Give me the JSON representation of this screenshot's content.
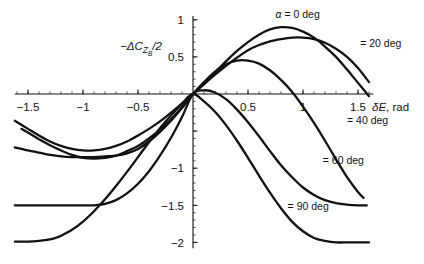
{
  "chart_data": {
    "type": "line",
    "title": "",
    "xlabel": "δE, rad",
    "ylabel": "−ΔC_{Z_B}/2",
    "xlabel_parts": {
      "delta": "δ",
      "var": "E",
      "rest": ", rad"
    },
    "ylabel_parts": {
      "minus": "−Δ",
      "c": "C",
      "sub": "Z",
      "subsub": "B",
      "div": "/2"
    },
    "xlim": [
      -1.62,
      1.64
    ],
    "ylim": [
      -2.08,
      1.05
    ],
    "grid": false,
    "legend_position": "inline-annotations",
    "xticks": [
      -1.5,
      -1,
      -0.5,
      0,
      0.5,
      1,
      1.5
    ],
    "xtick_labels": [
      "−1.5",
      "−1",
      "−0.5",
      "",
      "0.5",
      "1",
      "1.5"
    ],
    "yticks": [
      1,
      0.5,
      0,
      -0.5,
      -1,
      -1.5,
      -2
    ],
    "ytick_labels": [
      "1",
      "0.5",
      "",
      "",
      "−1",
      "−1.5",
      "−2"
    ],
    "minor_tick_step_x": 0.1,
    "minor_tick_step_y": 0.1,
    "series": [
      {
        "name": "alpha-0",
        "label": "α  = 0 deg",
        "label_alpha": "α",
        "label_rest": "= 0 deg",
        "alpha_deg": 0,
        "color": "#111111",
        "x": [
          -1.62,
          -1.5,
          -1.4,
          -1.3,
          -1.2,
          -1.1,
          -1.0,
          -0.9,
          -0.8,
          -0.7,
          -0.6,
          -0.5,
          -0.4,
          -0.3,
          -0.2,
          -0.1,
          0,
          0.1,
          0.2,
          0.3,
          0.4,
          0.5,
          0.6,
          0.7,
          0.8,
          0.9,
          1.0,
          1.1,
          1.2,
          1.3,
          1.4,
          1.5,
          1.6
        ],
        "y": [
          -0.36,
          -0.47,
          -0.56,
          -0.64,
          -0.7,
          -0.74,
          -0.76,
          -0.76,
          -0.74,
          -0.7,
          -0.64,
          -0.56,
          -0.47,
          -0.37,
          -0.25,
          -0.13,
          0,
          0.14,
          0.29,
          0.44,
          0.58,
          0.7,
          0.8,
          0.87,
          0.9,
          0.89,
          0.84,
          0.76,
          0.64,
          0.5,
          0.33,
          0.15,
          -0.03
        ]
      },
      {
        "name": "alpha-20",
        "label": "= 20 deg",
        "alpha_deg": 20,
        "color": "#111111",
        "x": [
          -1.56,
          -1.5,
          -1.4,
          -1.3,
          -1.2,
          -1.1,
          -1.0,
          -0.9,
          -0.8,
          -0.7,
          -0.6,
          -0.5,
          -0.4,
          -0.3,
          -0.2,
          -0.1,
          0,
          0.1,
          0.2,
          0.3,
          0.4,
          0.5,
          0.6,
          0.7,
          0.8,
          0.9,
          1.0,
          1.1,
          1.2,
          1.3,
          1.4,
          1.5,
          1.6
        ],
        "y": [
          -0.47,
          -0.52,
          -0.61,
          -0.69,
          -0.76,
          -0.82,
          -0.86,
          -0.87,
          -0.86,
          -0.83,
          -0.77,
          -0.7,
          -0.6,
          -0.48,
          -0.34,
          -0.18,
          0,
          0.13,
          0.26,
          0.38,
          0.49,
          0.59,
          0.66,
          0.71,
          0.74,
          0.76,
          0.76,
          0.74,
          0.69,
          0.61,
          0.5,
          0.35,
          0.16
        ]
      },
      {
        "name": "alpha-40",
        "label": "= 40 deg",
        "alpha_deg": 40,
        "color": "#111111",
        "x": [
          -1.62,
          -1.5,
          -1.4,
          -1.3,
          -1.2,
          -1.1,
          -1.0,
          -0.9,
          -0.8,
          -0.7,
          -0.6,
          -0.5,
          -0.4,
          -0.3,
          -0.2,
          -0.1,
          0,
          0.1,
          0.2,
          0.3,
          0.4,
          0.5,
          0.6,
          0.7,
          0.8,
          0.9,
          1.0,
          1.1,
          1.2,
          1.3,
          1.4,
          1.5,
          1.55
        ],
        "y": [
          -0.72,
          -0.76,
          -0.79,
          -0.82,
          -0.84,
          -0.85,
          -0.85,
          -0.85,
          -0.84,
          -0.83,
          -0.8,
          -0.74,
          -0.64,
          -0.51,
          -0.36,
          -0.19,
          0,
          0.16,
          0.3,
          0.4,
          0.45,
          0.45,
          0.41,
          0.32,
          0.19,
          0.03,
          -0.17,
          -0.39,
          -0.63,
          -0.88,
          -1.12,
          -1.32,
          -1.4
        ]
      },
      {
        "name": "alpha-60",
        "label": "= 60  deg",
        "alpha_deg": 60,
        "color": "#111111",
        "x": [
          -1.62,
          -1.5,
          -1.4,
          -1.3,
          -1.2,
          -1.1,
          -1.0,
          -0.9,
          -0.8,
          -0.7,
          -0.6,
          -0.5,
          -0.4,
          -0.3,
          -0.2,
          -0.1,
          0,
          0.1,
          0.2,
          0.3,
          0.4,
          0.5,
          0.6,
          0.7,
          0.8,
          0.9,
          1.0,
          1.1,
          1.2,
          1.3,
          1.4,
          1.5,
          1.58
        ],
        "y": [
          -1.5,
          -1.5,
          -1.5,
          -1.5,
          -1.5,
          -1.5,
          -1.5,
          -1.5,
          -1.48,
          -1.43,
          -1.34,
          -1.21,
          -1.04,
          -0.83,
          -0.59,
          -0.31,
          0,
          0.05,
          0.02,
          -0.07,
          -0.21,
          -0.38,
          -0.57,
          -0.77,
          -0.96,
          -1.12,
          -1.26,
          -1.36,
          -1.43,
          -1.47,
          -1.49,
          -1.5,
          -1.5
        ]
      },
      {
        "name": "alpha-90",
        "label": "= 90 deg",
        "alpha_deg": 90,
        "color": "#111111",
        "x": [
          -1.62,
          -1.5,
          -1.4,
          -1.3,
          -1.25,
          -1.2,
          -1.1,
          -1.0,
          -0.9,
          -0.8,
          -0.7,
          -0.6,
          -0.5,
          -0.4,
          -0.3,
          -0.2,
          -0.1,
          0,
          0.1,
          0.2,
          0.3,
          0.4,
          0.5,
          0.6,
          0.7,
          0.8,
          0.9,
          1.0,
          1.1,
          1.2,
          1.3,
          1.4,
          1.5,
          1.6
        ],
        "y": [
          -1.99,
          -1.99,
          -1.98,
          -1.96,
          -1.94,
          -1.91,
          -1.83,
          -1.72,
          -1.58,
          -1.42,
          -1.24,
          -1.05,
          -0.85,
          -0.65,
          -0.46,
          -0.29,
          -0.13,
          0,
          -0.1,
          -0.24,
          -0.42,
          -0.63,
          -0.86,
          -1.1,
          -1.33,
          -1.54,
          -1.72,
          -1.85,
          -1.94,
          -1.98,
          -2.0,
          -2.0,
          -2.0,
          -2.0
        ]
      }
    ],
    "annotations": [
      {
        "name": "label-alpha-0",
        "text": "α  = 0 deg",
        "x": 0.75,
        "y": 1.02
      },
      {
        "name": "label-alpha-20",
        "text": "= 20 deg",
        "x": 1.52,
        "y": 0.63
      },
      {
        "name": "label-alpha-40",
        "text": "= 40 deg",
        "x": 1.4,
        "y": -0.4
      },
      {
        "name": "label-alpha-60",
        "text": "= 60  deg",
        "x": 1.18,
        "y": -0.95
      },
      {
        "name": "label-alpha-90",
        "text": "= 90 deg",
        "x": 0.86,
        "y": -1.57
      }
    ]
  }
}
